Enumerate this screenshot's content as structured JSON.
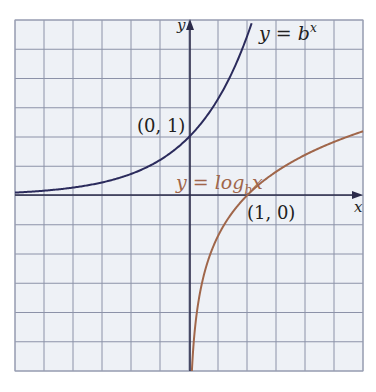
{
  "chart_data": {
    "type": "line",
    "title": "",
    "xlabel": "x",
    "ylabel": "y",
    "xlim": [
      -3,
      3
    ],
    "ylim": [
      -3,
      3
    ],
    "grid": true,
    "grid_step": 0.5,
    "legend": "none",
    "series": [
      {
        "name": "y = b^x",
        "label_base": "y = b",
        "label_sup": "x",
        "function": "exponential",
        "color": "#2b2b5c",
        "x": [
          -3,
          -2,
          -1,
          -0.5,
          0,
          0.5,
          1,
          1.1
        ],
        "y": [
          0.05,
          0.14,
          0.37,
          0.61,
          1,
          1.65,
          2.72,
          3.0
        ]
      },
      {
        "name": "y = log_b x",
        "label_base": "y = log",
        "label_sub": "b",
        "label_tail": "x",
        "function": "logarithm",
        "color": "#a0664a",
        "x": [
          0.05,
          0.14,
          0.37,
          0.61,
          1,
          1.65,
          2.72,
          3.0
        ],
        "y": [
          -3,
          -2,
          -1,
          -0.5,
          0,
          0.5,
          1,
          1.1
        ]
      }
    ],
    "annotations": [
      {
        "text": "(0, 1)",
        "x": 0,
        "y": 1
      },
      {
        "text": "(1, 0)",
        "x": 1,
        "y": 0
      }
    ]
  },
  "labels": {
    "x_axis": "x",
    "y_axis": "y",
    "point_exp": "(0, 1)",
    "point_log": "(1, 0)",
    "exp_base": "y = b",
    "exp_sup": "x",
    "log_base": "y = log",
    "log_sub": "b",
    "log_tail": "x"
  },
  "colors": {
    "background": "#eef1f6",
    "grid": "#8c92a8",
    "axis": "#2b2b4a",
    "exp_curve": "#2b2b5c",
    "log_curve": "#a0664a",
    "text": "#222222"
  }
}
